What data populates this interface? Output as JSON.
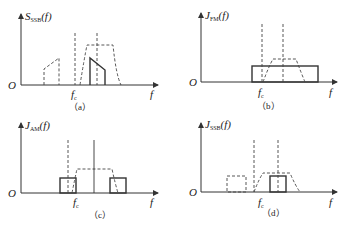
{
  "panels": [
    {
      "id": "a",
      "ylabel_main": "S",
      "ylabel_sub": "SSB",
      "ylabel_arg": "(f)",
      "origin_label": "O",
      "x_label": "f",
      "carrier_label": "f",
      "carrier_sub": "c",
      "caption": "（a）"
    },
    {
      "id": "b",
      "ylabel_main": "J",
      "ylabel_sub": "FM",
      "ylabel_arg": "(f)",
      "origin_label": "O",
      "x_label": "f",
      "carrier_label": "f",
      "carrier_sub": "c",
      "caption": "（b）"
    },
    {
      "id": "c",
      "ylabel_main": "J",
      "ylabel_sub": "AM",
      "ylabel_arg": "(f)",
      "origin_label": "O",
      "x_label": "f",
      "carrier_label": "f",
      "carrier_sub": "c",
      "caption": "（c）"
    },
    {
      "id": "d",
      "ylabel_main": "J",
      "ylabel_sub": "SSB",
      "ylabel_arg": "(f)",
      "origin_label": "O",
      "x_label": "f",
      "carrier_label": "f",
      "carrier_sub": "c",
      "caption": "（d）"
    }
  ],
  "colors": {
    "line": "#333333",
    "background": "#ffffff"
  }
}
